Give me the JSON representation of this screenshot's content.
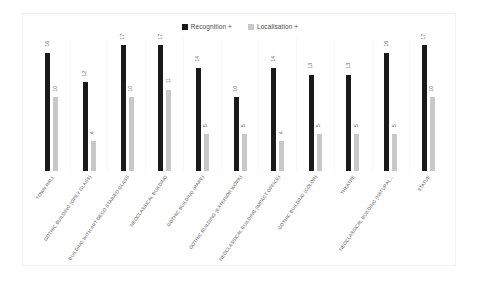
{
  "chart_data": {
    "type": "bar",
    "title": "",
    "subtitle": "",
    "xlabel": "",
    "ylabel": "",
    "ylim": [
      0,
      18
    ],
    "grid": true,
    "legend_position": "top-center",
    "categories": [
      "TOWN HALL",
      "GOTHIC BUILDING (GREY GLASS)",
      "BUILDING WITH ART DECO STAINED GLASS",
      "NEOCLASSICAL BUILDING",
      "GOTHIC BUILDING (RARE)",
      "GOTHIC BUILDING (EXTERIOR WORK)",
      "NEOCLASSICAL BUILDING (IMPACT OFFICE)",
      "GOTHIC BUILDING (COLOR)",
      "THEATRE",
      "NEOCLASSICAL BUILDING (NATURAL...",
      "STATUE"
    ],
    "series": [
      {
        "name": "Recognition +",
        "color": "#1a1a1a",
        "values": [
          16,
          12,
          17,
          17,
          14,
          10,
          14,
          13,
          13,
          16,
          17
        ]
      },
      {
        "name": "Localisation +",
        "color": "#c8c8c8",
        "values": [
          10,
          4,
          10,
          11,
          5,
          5,
          4,
          5,
          5,
          5,
          10
        ]
      }
    ]
  },
  "legend": {
    "entries": [
      {
        "label": "Recognition +",
        "swatch": "recognition-swatch"
      },
      {
        "label": "Localisation +",
        "swatch": "localisation-swatch"
      }
    ]
  }
}
